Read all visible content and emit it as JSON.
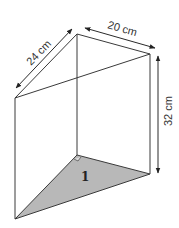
{
  "diagram": {
    "type": "triangular-prism",
    "labels": {
      "depth": "24 cm",
      "width": "20 cm",
      "height": "32 cm",
      "base_face": "1"
    },
    "colors": {
      "base_fill": "#b8b8b8",
      "edge": "#3a3a3a",
      "background": "#ffffff"
    },
    "features": {
      "right_angle_marker": true
    }
  }
}
